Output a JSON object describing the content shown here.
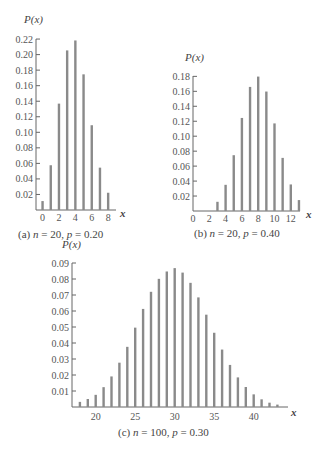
{
  "chart_data": [
    {
      "type": "bar",
      "title": "(a)  n = 20, p = 0.20",
      "caption_prefix": "(a)",
      "n": 20,
      "p": 0.2,
      "xlabel": "x",
      "ylabel": "P(x)",
      "x": [
        0,
        1,
        2,
        3,
        4,
        5,
        6,
        7,
        8
      ],
      "values": [
        0.0115,
        0.0576,
        0.1369,
        0.2054,
        0.2182,
        0.1746,
        0.1091,
        0.0545,
        0.0222
      ],
      "xticks": [
        0,
        2,
        4,
        6,
        8
      ],
      "yticks": [
        0.02,
        0.04,
        0.06,
        0.08,
        0.1,
        0.12,
        0.14,
        0.16,
        0.18,
        0.2,
        0.22
      ],
      "ytick_labels": [
        "0.02",
        "0.04",
        "0.06",
        "0.08",
        "0.10",
        "0.12",
        "0.14",
        "0.16",
        "0.18",
        "0.20",
        "0.22"
      ],
      "ylim": [
        0,
        0.22
      ],
      "grid": false
    },
    {
      "type": "bar",
      "title": "(b)  n = 20, p = 0.40",
      "caption_prefix": "(b)",
      "n": 20,
      "p": 0.4,
      "xlabel": "x",
      "ylabel": "P(x)",
      "x": [
        3,
        4,
        5,
        6,
        7,
        8,
        9,
        10,
        11,
        12,
        13
      ],
      "values": [
        0.0123,
        0.035,
        0.0746,
        0.1244,
        0.1659,
        0.1797,
        0.1597,
        0.1171,
        0.071,
        0.0355,
        0.0146
      ],
      "xticks": [
        0,
        2,
        4,
        6,
        8,
        10,
        12
      ],
      "yticks": [
        0.02,
        0.04,
        0.06,
        0.08,
        0.1,
        0.12,
        0.14,
        0.16,
        0.18
      ],
      "ytick_labels": [
        "0.02",
        "0.04",
        "0.06",
        "0.08",
        "0.10",
        "0.12",
        "0.14",
        "0.16",
        "0.18"
      ],
      "ylim": [
        0,
        0.18
      ],
      "grid": false
    },
    {
      "type": "bar",
      "title": "(c)  n = 100, p = 0.30",
      "caption_prefix": "(c)",
      "n": 100,
      "p": 0.3,
      "xlabel": "x",
      "ylabel": "P(x)",
      "x": [
        18,
        19,
        20,
        21,
        22,
        23,
        24,
        25,
        26,
        27,
        28,
        29,
        30,
        31,
        32,
        33,
        34,
        35,
        36,
        37,
        38,
        39,
        40,
        41,
        42,
        43
      ],
      "values": [
        0.0032,
        0.005,
        0.0076,
        0.0124,
        0.0191,
        0.0277,
        0.0376,
        0.0496,
        0.0613,
        0.072,
        0.0801,
        0.0847,
        0.0868,
        0.084,
        0.0776,
        0.0685,
        0.0577,
        0.0464,
        0.0359,
        0.0263,
        0.0185,
        0.0125,
        0.0079,
        0.0048,
        0.0027,
        0.0015
      ],
      "xticks": [
        20,
        25,
        30,
        35,
        40
      ],
      "yticks": [
        0.01,
        0.02,
        0.03,
        0.04,
        0.05,
        0.06,
        0.07,
        0.08,
        0.09
      ],
      "ytick_labels": [
        "0.01",
        "0.02",
        "0.03",
        "0.04",
        "0.05",
        "0.06",
        "0.07",
        "0.08",
        "0.09"
      ],
      "ylim": [
        0,
        0.09
      ],
      "grid": false
    }
  ],
  "colors": {
    "bar": "#8a8a8a",
    "axis": "#666666",
    "text": "#444444"
  },
  "labels": {
    "a": {
      "ylabel": "P(x)",
      "xlabel": "x",
      "n": "n",
      "eq1": "= 20,",
      "p": "p",
      "eq2": "= 0.20",
      "prefix": "(a)"
    },
    "b": {
      "ylabel": "P(x)",
      "xlabel": "x",
      "n": "n",
      "eq1": "= 20,",
      "p": "p",
      "eq2": "= 0.40",
      "prefix": "(b)"
    },
    "c": {
      "ylabel": "P(x)",
      "xlabel": "x",
      "n": "n",
      "eq1": "= 100,",
      "p": "p",
      "eq2": "= 0.30",
      "prefix": "(c)"
    }
  }
}
